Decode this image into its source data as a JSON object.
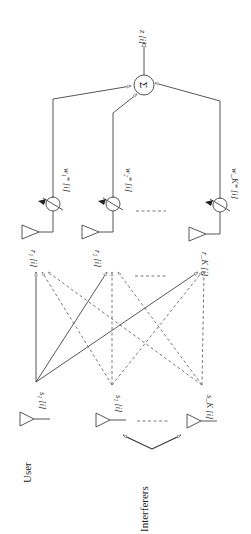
{
  "diagram": {
    "type": "antenna-array-beamformer",
    "orientation": "rotated-90-ccw",
    "output": {
      "label": "z [i]",
      "combiner_symbol": "Σ"
    },
    "receivers": [
      {
        "signal": "r₁ [i]",
        "weight": "w₁* [i]"
      },
      {
        "signal": "r₂ [i]",
        "weight": "w₂* [i]"
      },
      {
        "signal": "r_K [i]",
        "weight": "w_K* [i]"
      }
    ],
    "sources": [
      {
        "signal": "s₁ [i]",
        "role": "user"
      },
      {
        "signal": "s₂ [i]",
        "role": "interferer"
      },
      {
        "signal": "s_K [i]",
        "role": "interferer"
      }
    ],
    "group_labels": {
      "user": "User",
      "interferers": "Interferers"
    },
    "colors": {
      "line": "#444444",
      "background": "#ffffff"
    }
  }
}
